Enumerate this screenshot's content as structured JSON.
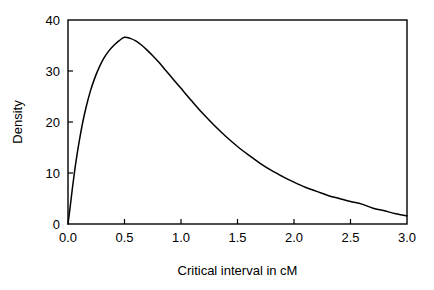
{
  "chart_data": {
    "type": "line",
    "title": "",
    "subtitle": "",
    "xlabel": "Critical interval in cM",
    "ylabel": "Density",
    "xlim": [
      0.0,
      3.0
    ],
    "ylim": [
      0,
      40
    ],
    "grid": false,
    "legend": null,
    "legend_position": "none",
    "line_color": "#000000",
    "frame_color": "#000000",
    "background_color": "#ffffff",
    "xticks": [
      0.0,
      0.5,
      1.0,
      1.5,
      2.0,
      2.5,
      3.0
    ],
    "xtick_labels": [
      "0.0",
      "0.5",
      "1.0",
      "1.5",
      "2.0",
      "2.5",
      "3.0"
    ],
    "yticks": [
      0,
      10,
      20,
      30,
      40
    ],
    "ytick_labels": [
      "0",
      "10",
      "20",
      "30",
      "40"
    ],
    "series": [
      {
        "name": "Density",
        "x": [
          0.0,
          0.02,
          0.04,
          0.06,
          0.08,
          0.1,
          0.13,
          0.16,
          0.2,
          0.24,
          0.28,
          0.32,
          0.36,
          0.4,
          0.45,
          0.5,
          0.55,
          0.6,
          0.65,
          0.7,
          0.75,
          0.8,
          0.85,
          0.9,
          0.95,
          1.0,
          1.1,
          1.2,
          1.3,
          1.4,
          1.5,
          1.6,
          1.7,
          1.8,
          1.9,
          2.0,
          2.1,
          2.2,
          2.3,
          2.4,
          2.5,
          2.6,
          2.7,
          2.8,
          2.9,
          3.0
        ],
        "y": [
          0.0,
          3.5,
          7.2,
          10.6,
          13.6,
          16.3,
          19.9,
          22.9,
          26.2,
          28.8,
          30.9,
          32.6,
          33.9,
          34.9,
          35.9,
          36.6,
          36.4,
          35.9,
          35.1,
          34.1,
          33.0,
          31.8,
          30.5,
          29.2,
          27.9,
          26.6,
          24.0,
          21.5,
          19.2,
          17.1,
          15.2,
          13.5,
          11.9,
          10.5,
          9.3,
          8.2,
          7.2,
          6.4,
          5.6,
          5.0,
          4.4,
          3.9,
          3.1,
          2.6,
          2.0,
          1.6
        ]
      }
    ],
    "annotations": [
      {
        "label": "peak",
        "x": 0.5,
        "y": 36.6
      }
    ]
  },
  "axes": {
    "x": {
      "title": "Critical interval in cM",
      "tick_labels": [
        "0.0",
        "0.5",
        "1.0",
        "1.5",
        "2.0",
        "2.5",
        "3.0"
      ]
    },
    "y": {
      "title": "Density",
      "tick_labels": [
        "0",
        "10",
        "20",
        "30",
        "40"
      ]
    }
  }
}
